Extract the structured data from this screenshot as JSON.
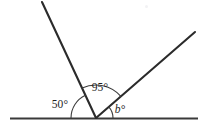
{
  "figure": {
    "width": 208,
    "height": 134,
    "background_color": "#ffffff",
    "line_color": "#2b2b2b",
    "baseline_color": "#3a3a3a",
    "arc_color": "#3d3d3d",
    "label_color": "#1f1f1f"
  },
  "geometry": {
    "vertex": {
      "x": 96,
      "y": 118
    },
    "baseline": {
      "x1": 10,
      "y1": 118,
      "x2": 198,
      "y2": 118
    },
    "rays": [
      {
        "name": "steep-left-ray",
        "x1": 96,
        "y1": 118,
        "x2": 42,
        "y2": 2
      },
      {
        "name": "right-ray",
        "x1": 96,
        "y1": 118,
        "x2": 195,
        "y2": 32
      }
    ],
    "arcs": [
      {
        "name": "arc-50",
        "radius": 25,
        "start_deg": 180,
        "end_deg": 115
      },
      {
        "name": "arc-95",
        "radius": 33,
        "start_deg": 115,
        "end_deg": 41
      },
      {
        "name": "arc-b",
        "radius": 17,
        "start_deg": 41,
        "end_deg": 0
      }
    ]
  },
  "labels": {
    "left_angle": {
      "text": "50°",
      "value": 50,
      "unit": "degrees",
      "x": 60,
      "y": 108,
      "italic": false
    },
    "middle_angle": {
      "text": "95°",
      "value": 95,
      "unit": "degrees",
      "x": 88,
      "y": 91,
      "italic": false
    },
    "right_angle": {
      "text": "b°",
      "value": "b",
      "unit": "degrees",
      "x": 113,
      "y": 113,
      "italic": true
    }
  }
}
